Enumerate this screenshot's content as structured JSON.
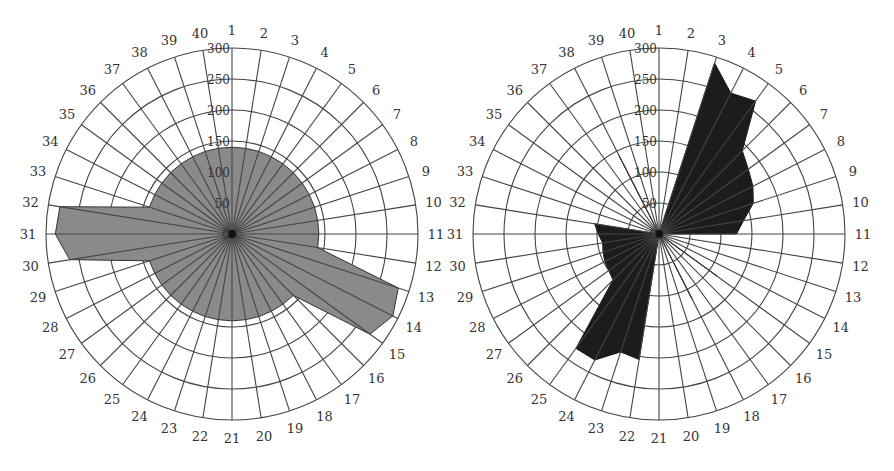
{
  "chart_data": [
    {
      "type": "radar",
      "title": "",
      "position": "left",
      "categories": [
        "1",
        "2",
        "3",
        "4",
        "5",
        "6",
        "7",
        "8",
        "9",
        "10",
        "11",
        "12",
        "13",
        "14",
        "15",
        "16",
        "17",
        "18",
        "19",
        "20",
        "21",
        "22",
        "23",
        "24",
        "25",
        "26",
        "27",
        "28",
        "29",
        "30",
        "31",
        "32",
        "33",
        "34",
        "35",
        "36",
        "37",
        "38",
        "39",
        "40"
      ],
      "values": [
        140,
        140,
        140,
        140,
        140,
        140,
        140,
        140,
        140,
        140,
        140,
        140,
        282,
        291,
        275,
        140,
        140,
        140,
        140,
        140,
        140,
        140,
        140,
        140,
        140,
        140,
        140,
        140,
        140,
        265,
        285,
        281,
        140,
        140,
        140,
        140,
        140,
        140,
        140,
        140
      ],
      "radial_ticks": [
        0,
        50,
        100,
        150,
        200,
        250,
        300
      ],
      "rlim": [
        0,
        300
      ],
      "fill_color": "#8a8a8a",
      "stroke_color": "#333333",
      "grid": true,
      "legend": null
    },
    {
      "type": "radar",
      "title": "",
      "position": "right",
      "categories": [
        "1",
        "2",
        "3",
        "4",
        "5",
        "6",
        "7",
        "8",
        "9",
        "10",
        "11",
        "12",
        "13",
        "14",
        "15",
        "16",
        "17",
        "18",
        "19",
        "20",
        "21",
        "22",
        "23",
        "24",
        "25",
        "26",
        "27",
        "28",
        "29",
        "30",
        "31",
        "32",
        "33",
        "34",
        "35",
        "36",
        "37",
        "38",
        "39",
        "40"
      ],
      "values": [
        0,
        0,
        290,
        255,
        265,
        190,
        178,
        170,
        160,
        138,
        125,
        0,
        0,
        0,
        117,
        0,
        0,
        118,
        0,
        0,
        0,
        205,
        200,
        228,
        228,
        105,
        100,
        98,
        95,
        92,
        98,
        105,
        0,
        0,
        0,
        0,
        0,
        142,
        0,
        0
      ],
      "radial_ticks": [
        0,
        50,
        100,
        150,
        200,
        250,
        300
      ],
      "rlim": [
        0,
        300
      ],
      "fill_color": "#1c1c1c",
      "stroke_color": "#1c1c1c",
      "grid": true,
      "legend": null
    }
  ],
  "layout": {
    "charts": [
      {
        "cx": 232,
        "cy": 234,
        "radius": 186
      },
      {
        "cx": 659,
        "cy": 234,
        "radius": 186
      }
    ],
    "label_offset": 18,
    "grid_color": "#444444"
  }
}
